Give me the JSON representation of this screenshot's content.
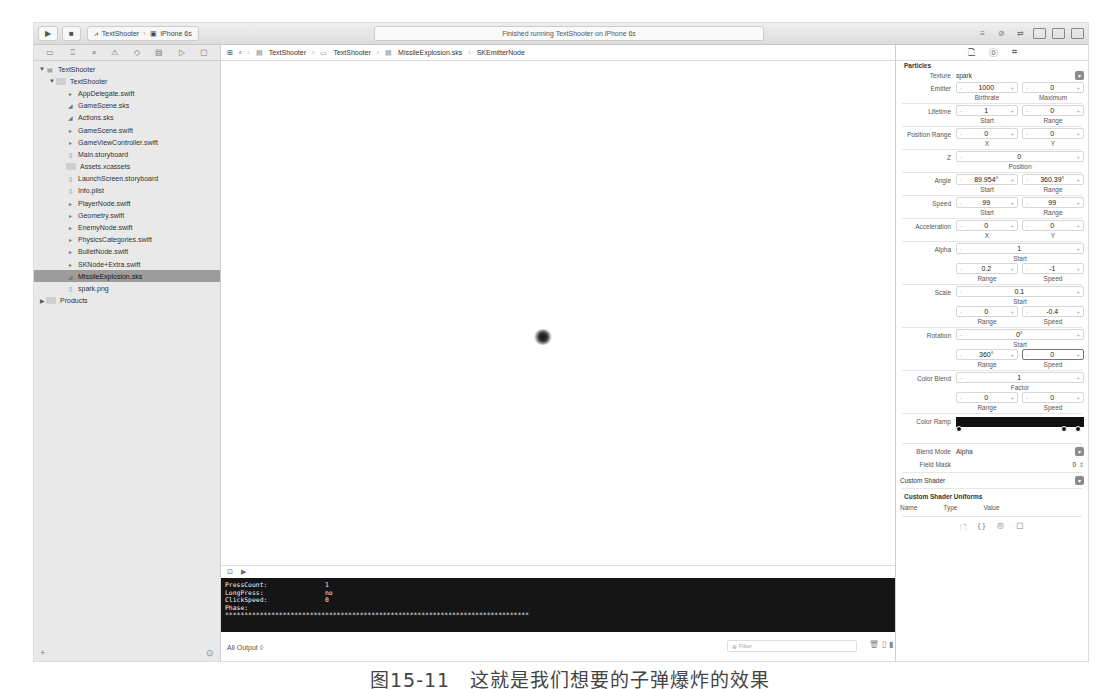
{
  "toolbar": {
    "run_icon": "play-icon",
    "stop_icon": "stop-icon",
    "scheme": "TextShooter",
    "device": "iPhone 6s",
    "status": "Finished running TextShooter on iPhone 6s"
  },
  "navigator": {
    "icons": [
      "folder-icon",
      "hierarchy-icon",
      "search-icon",
      "warning-icon",
      "test-icon",
      "debug-icon",
      "breakpoint-icon",
      "report-icon"
    ],
    "items": [
      {
        "label": "TextShooter",
        "level": 0,
        "type": "project",
        "disclosure": "▼"
      },
      {
        "label": "TextShooter",
        "level": 1,
        "type": "folder",
        "disclosure": "▼"
      },
      {
        "label": "AppDelegate.swift",
        "level": 2,
        "type": "swift"
      },
      {
        "label": "GameScene.sks",
        "level": 2,
        "type": "sks"
      },
      {
        "label": "Actions.sks",
        "level": 2,
        "type": "sks"
      },
      {
        "label": "GameScene.swift",
        "level": 2,
        "type": "swift"
      },
      {
        "label": "GameViewController.swift",
        "level": 2,
        "type": "swift"
      },
      {
        "label": "Main.storyboard",
        "level": 2,
        "type": "storyboard"
      },
      {
        "label": "Assets.xcassets",
        "level": 2,
        "type": "assets"
      },
      {
        "label": "LaunchScreen.storyboard",
        "level": 2,
        "type": "storyboard"
      },
      {
        "label": "Info.plist",
        "level": 2,
        "type": "plist"
      },
      {
        "label": "PlayerNode.swift",
        "level": 2,
        "type": "swift"
      },
      {
        "label": "Geometry.swift",
        "level": 2,
        "type": "swift"
      },
      {
        "label": "EnemyNode.swift",
        "level": 2,
        "type": "swift"
      },
      {
        "label": "PhysicsCategories.swift",
        "level": 2,
        "type": "swift"
      },
      {
        "label": "BulletNode.swift",
        "level": 2,
        "type": "swift"
      },
      {
        "label": "SKNode+Extra.swift",
        "level": 2,
        "type": "swift"
      },
      {
        "label": "MissileExplosion.sks",
        "level": 2,
        "type": "sks",
        "selected": true
      },
      {
        "label": "spark.png",
        "level": 2,
        "type": "png"
      },
      {
        "label": "Products",
        "level": 0,
        "type": "folder",
        "disclosure": "▶"
      }
    ],
    "bottom": {
      "add": "+",
      "filter_icon": "filter-icon"
    }
  },
  "jumpbar": {
    "crumbs": [
      "TextShooter",
      "TextShooter",
      "MissileExplosion.sks",
      "SKEmitterNode"
    ]
  },
  "console": {
    "lines": [
      {
        "key": "PressCount:",
        "value": "1"
      },
      {
        "key": "LongPress:",
        "value": "no"
      },
      {
        "key": "ClickSpeed:",
        "value": "0"
      },
      {
        "key": "Phase:",
        "value": ""
      }
    ],
    "stars": "*******************************************************************************",
    "output_selector": "All Output ◊",
    "filter_placeholder": "Filter"
  },
  "inspector": {
    "section": "Particles",
    "texture": {
      "label": "Texture",
      "value": "spark"
    },
    "rows": [
      {
        "label": "Emitter",
        "fields": [
          {
            "value": "1000",
            "cap": "Birthrate"
          },
          {
            "value": "0",
            "cap": "Maximum"
          }
        ]
      },
      {
        "label": "Lifetime",
        "fields": [
          {
            "value": "1",
            "cap": "Start"
          },
          {
            "value": "0",
            "cap": "Range"
          }
        ]
      },
      {
        "label": "Position Range",
        "fields": [
          {
            "value": "0",
            "cap": "X"
          },
          {
            "value": "0",
            "cap": "Y"
          }
        ]
      },
      {
        "label": "Z",
        "fields": [
          {
            "value": "0",
            "cap": "Position"
          }
        ]
      },
      {
        "label": "Angle",
        "fields": [
          {
            "value": "89.954°",
            "cap": "Start"
          },
          {
            "value": "360.39°",
            "cap": "Range"
          }
        ]
      },
      {
        "label": "Speed",
        "fields": [
          {
            "value": "99",
            "cap": "Start"
          },
          {
            "value": "99",
            "cap": "Range"
          }
        ]
      },
      {
        "label": "Acceleration",
        "fields": [
          {
            "value": "0",
            "cap": "X"
          },
          {
            "value": "0",
            "cap": "Y"
          }
        ]
      },
      {
        "label": "Alpha",
        "fields": [
          {
            "value": "1",
            "cap": "Start"
          }
        ]
      },
      {
        "label": "",
        "fields": [
          {
            "value": "0.2",
            "cap": "Range"
          },
          {
            "value": "-1",
            "cap": "Speed"
          }
        ]
      },
      {
        "label": "Scale",
        "fields": [
          {
            "value": "0.1",
            "cap": "Start"
          }
        ]
      },
      {
        "label": "",
        "fields": [
          {
            "value": "0",
            "cap": "Range"
          },
          {
            "value": "-0.4",
            "cap": "Speed"
          }
        ]
      },
      {
        "label": "Rotation",
        "fields": [
          {
            "value": "0°",
            "cap": "Start"
          }
        ]
      },
      {
        "label": "",
        "fields": [
          {
            "value": "360°",
            "cap": "Range"
          },
          {
            "value": "0",
            "cap": "Speed",
            "focus": true
          }
        ]
      },
      {
        "label": "Color Blend",
        "fields": [
          {
            "value": "1",
            "cap": "Factor"
          }
        ]
      },
      {
        "label": "",
        "fields": [
          {
            "value": "0",
            "cap": "Range"
          },
          {
            "value": "0",
            "cap": "Speed"
          }
        ]
      }
    ],
    "color_ramp": "Color Ramp",
    "blend_mode": {
      "label": "Blend Mode",
      "value": "Alpha"
    },
    "field_mask": {
      "label": "Field Mask",
      "value": "0"
    },
    "custom_shader": "Custom Shader",
    "uniforms": {
      "title": "Custom Shader Uniforms",
      "cols": [
        "Name",
        "Type",
        "Value"
      ]
    }
  },
  "caption": "图15-11　这就是我们想要的子弹爆炸的效果"
}
